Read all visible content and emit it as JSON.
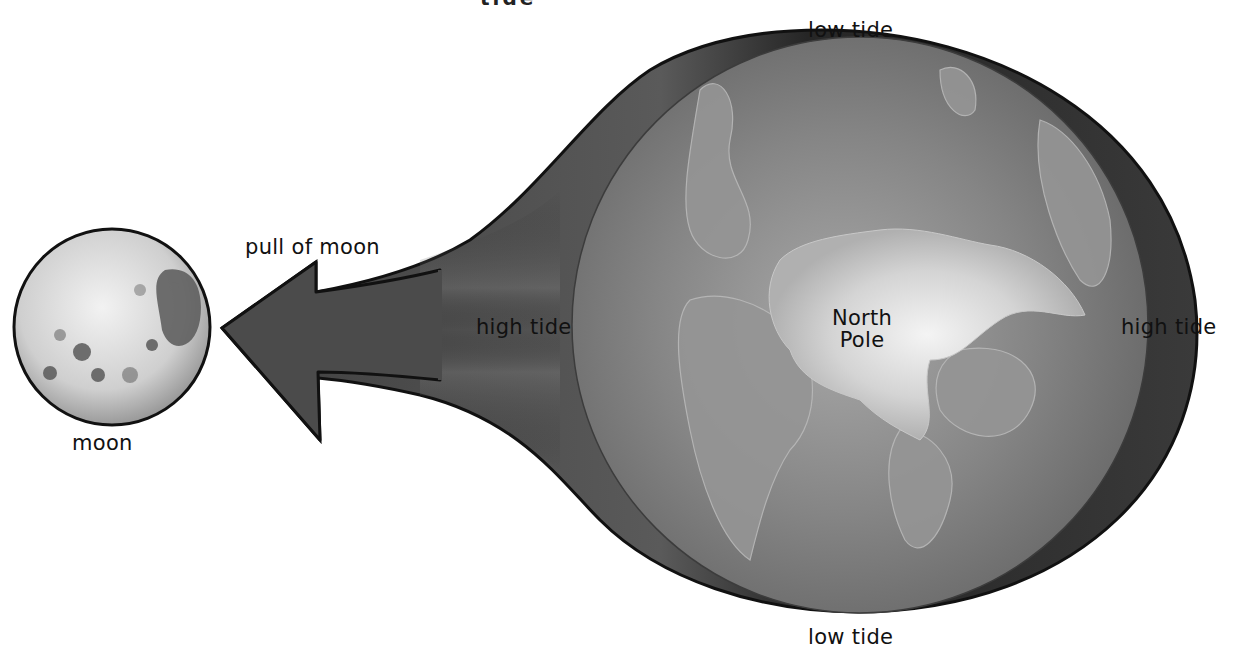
{
  "diagram": {
    "title_fragment": "tide",
    "labels": {
      "low_tide_top": "low tide",
      "low_tide_bottom": "low tide",
      "high_tide_left": "high tide",
      "high_tide_right": "high tide",
      "pull_of_moon": "pull of moon",
      "moon": "moon",
      "north_pole_line1": "North",
      "north_pole_line2": "Pole"
    },
    "objects": {
      "moon": "moon-sphere",
      "earth": "earth-globe-north-pole-view",
      "tidal_bulge": "water-envelope-bulge",
      "arrow": "gravity-pull-arrow"
    },
    "colors": {
      "background": "#ffffff",
      "outline": "#111111",
      "water_dark": "#2a2a2a",
      "water_mid": "#4a4a4a",
      "earth_ocean": "#7a7a7a",
      "earth_land": "#9a9a9a",
      "ice_cap": "#e4e4e4",
      "moon_light": "#d8d8d8",
      "moon_dark": "#555555",
      "arrow_fill": "#4b4b4b"
    }
  }
}
